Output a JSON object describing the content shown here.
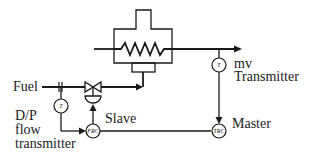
{
  "diagram": {
    "type": "cascade control loop (furnace temperature master, fuel flow slave)",
    "colors": {
      "line": "#1a1a1a",
      "background": "#ffffff"
    },
    "labels": {
      "fuel": "Fuel",
      "dp_line1": "D/P",
      "dp_line2": "flow",
      "dp_line3": "transmitter",
      "slave": "Slave",
      "master": "Master",
      "mv_line1": "mv",
      "mv_line2": "Transmitter"
    },
    "instruments": {
      "flow_transmitter_tag": "T",
      "mv_transmitter_tag": "T",
      "slave_controller_tag": "FRC",
      "master_controller_tag": "TRC"
    },
    "components": [
      "furnace",
      "heating-coil",
      "burner",
      "orifice-plate",
      "control-valve",
      "valve-actuator"
    ]
  }
}
